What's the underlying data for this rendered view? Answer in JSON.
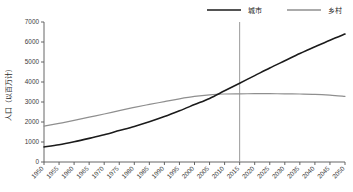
{
  "chart_data": {
    "type": "line",
    "title": "",
    "xlabel": "",
    "ylabel": "人口（以百万计）",
    "xlim": [
      1950,
      2050
    ],
    "ylim": [
      0,
      7000
    ],
    "ytick_step": 1000,
    "xtick_step": 5,
    "grid": false,
    "legend_position": "top-right",
    "yticks": [
      "0",
      "1000",
      "2000",
      "3000",
      "4000",
      "5000",
      "6000",
      "7000"
    ],
    "x": [
      1950,
      1955,
      1960,
      1965,
      1970,
      1975,
      1980,
      1985,
      1990,
      1995,
      2000,
      2005,
      2010,
      2015,
      2020,
      2025,
      2030,
      2035,
      2040,
      2045,
      2050
    ],
    "xticks": [
      "1950",
      "1955",
      "1960",
      "1965",
      "1970",
      "1975",
      "1980",
      "1985",
      "1990",
      "1995",
      "2000",
      "2005",
      "2010",
      "2015",
      "2020",
      "2025",
      "2030",
      "2035",
      "2040",
      "2045",
      "2050"
    ],
    "series": [
      {
        "name": "城市",
        "color": "#1b1b1b",
        "values": [
          750,
          860,
          1010,
          1180,
          1360,
          1570,
          1780,
          2010,
          2270,
          2560,
          2870,
          3180,
          3560,
          3940,
          4320,
          4700,
          5060,
          5420,
          5760,
          6090,
          6400
        ]
      },
      {
        "name": "乡村",
        "color": "#8f8f8f",
        "values": [
          1790,
          1930,
          2080,
          2240,
          2400,
          2570,
          2730,
          2880,
          3020,
          3160,
          3280,
          3360,
          3400,
          3410,
          3415,
          3415,
          3410,
          3400,
          3385,
          3345,
          3285
        ]
      }
    ],
    "annotations": [
      {
        "type": "vertical-line",
        "x": 2015,
        "color": "#9a9a9a"
      }
    ]
  },
  "legend": {
    "items": [
      {
        "label": "城市",
        "color": "#1b1b1b"
      },
      {
        "label": "乡村",
        "color": "#8f8f8f"
      }
    ]
  },
  "axes": {
    "y_title": "人口（以百万计）"
  }
}
